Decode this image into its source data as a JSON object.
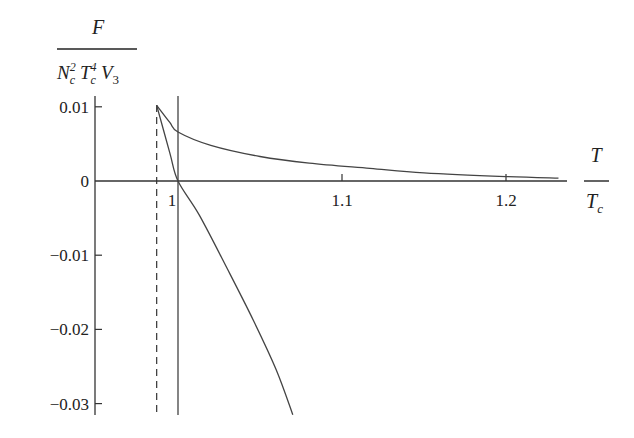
{
  "chart_data": {
    "type": "line",
    "title": "",
    "ylabel": {
      "numerator": "F",
      "denominator_parts": [
        {
          "base": "N",
          "sup": "2",
          "sub": "c"
        },
        {
          "base": "T",
          "sup": "4",
          "sub": "c"
        },
        {
          "base": "V",
          "sup": "",
          "sub": "3"
        }
      ]
    },
    "xlabel": {
      "numerator": "T",
      "denominator": "T",
      "denominator_sub": "c"
    },
    "xlim": [
      0.949,
      1.237
    ],
    "ylim": [
      -0.0315,
      0.0115
    ],
    "x_ticks": [
      {
        "value": 1.0,
        "label": "1"
      },
      {
        "value": 1.1,
        "label": "1.1"
      },
      {
        "value": 1.2,
        "label": "1.2"
      }
    ],
    "y_ticks": [
      {
        "value": 0.01,
        "label": "0.01"
      },
      {
        "value": 0.0,
        "label": "0"
      },
      {
        "value": -0.01,
        "label": "−0.01"
      },
      {
        "value": -0.02,
        "label": "−0.02"
      },
      {
        "value": -0.03,
        "label": "−0.03"
      }
    ],
    "grid": false,
    "legend": null,
    "series": [
      {
        "name": "upper-branch",
        "x": [
          0.987,
          0.995,
          1.0,
          1.02,
          1.05,
          1.08,
          1.117,
          1.15,
          1.2,
          1.232
        ],
        "y": [
          0.0102,
          0.0079,
          0.0066,
          0.0048,
          0.0033,
          0.0024,
          0.0017,
          0.0011,
          0.0006,
          0.0004
        ]
      },
      {
        "name": "lower-branch",
        "x": [
          0.987,
          0.995,
          1.0,
          1.013,
          1.03,
          1.046,
          1.06,
          1.07
        ],
        "y": [
          0.0102,
          0.0038,
          0.0,
          -0.0046,
          -0.0118,
          -0.0188,
          -0.0255,
          -0.0315
        ]
      }
    ],
    "vertical_lines": [
      {
        "x": 0.987,
        "style": "dashed"
      },
      {
        "x": 1.0,
        "style": "solid"
      }
    ]
  }
}
